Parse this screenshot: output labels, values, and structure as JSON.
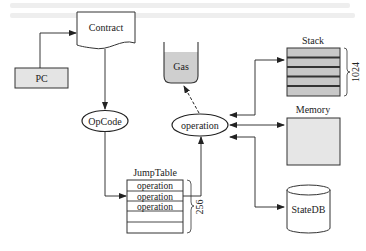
{
  "diagram": {
    "nodes": {
      "pc": {
        "label": "PC",
        "fill": "#e4e4e4"
      },
      "contract": {
        "label": "Contract"
      },
      "opcode": {
        "label": "OpCode"
      },
      "gas": {
        "label": "Gas",
        "fill": "#cfcfcf"
      },
      "operation": {
        "label": "operation"
      },
      "jumptable": {
        "title": "JumpTable",
        "rows": [
          "operation",
          "operation",
          "operation",
          "",
          ""
        ],
        "size_label": "256"
      },
      "stack": {
        "title": "Stack",
        "size_label": "1024",
        "fill": "#c8c8c8",
        "separator": "#333333"
      },
      "memory": {
        "title": "Memory",
        "fill": "#e6e6e6"
      },
      "statedb": {
        "label": "StateDB"
      }
    },
    "edges": [
      {
        "from": "PC",
        "to": "Contract",
        "style": "solid"
      },
      {
        "from": "Contract",
        "to": "OpCode",
        "style": "solid"
      },
      {
        "from": "OpCode",
        "to": "JumpTable",
        "style": "solid"
      },
      {
        "from": "JumpTable",
        "to": "operation",
        "style": "solid"
      },
      {
        "from": "operation",
        "to": "Gas",
        "style": "dashed"
      },
      {
        "from": "operation",
        "to": "Stack",
        "style": "bidirectional"
      },
      {
        "from": "operation",
        "to": "Memory",
        "style": "bidirectional"
      },
      {
        "from": "operation",
        "to": "StateDB",
        "style": "bidirectional"
      }
    ],
    "line_color": "#222222"
  }
}
